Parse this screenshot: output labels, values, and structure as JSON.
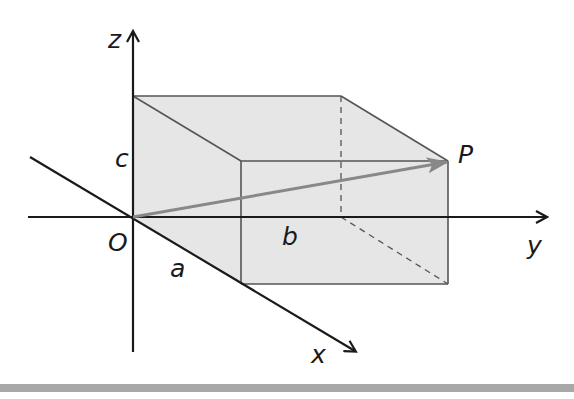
{
  "figure": {
    "labels": {
      "z_axis": "z",
      "y_axis": "y",
      "x_axis": "x",
      "origin": "O",
      "point": "P",
      "edge_x": "a",
      "edge_y": "b",
      "edge_z": "c"
    },
    "colors": {
      "axis": "#1a1a1a",
      "box_edge": "#555555",
      "box_fill": "#e6e6e6",
      "vector": "#888888",
      "footer_bar": "#a8a8a8"
    }
  }
}
